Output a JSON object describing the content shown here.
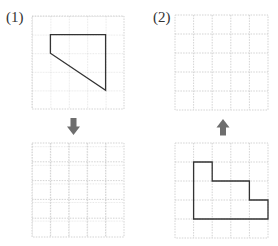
{
  "problems": [
    {
      "label": "(1)",
      "arrow": "down",
      "shape": "trapezoid-quadrilateral",
      "shape_points": [
        [
          1,
          1
        ],
        [
          4,
          1
        ],
        [
          4,
          4
        ],
        [
          1,
          2
        ]
      ],
      "shape_grid": "top"
    },
    {
      "label": "(2)",
      "arrow": "up",
      "shape": "staircase-polygon",
      "shape_points": [
        [
          1,
          1
        ],
        [
          2,
          1
        ],
        [
          2,
          2
        ],
        [
          4,
          2
        ],
        [
          4,
          3
        ],
        [
          5,
          3
        ],
        [
          5,
          4
        ],
        [
          1,
          4
        ]
      ],
      "shape_grid": "bottom"
    }
  ],
  "grid": {
    "rows": 5,
    "cols": 5
  },
  "colors": {
    "grid_line": "#c8c8c8",
    "shape_stroke": "#333333",
    "arrow": "#6e6e6e"
  }
}
